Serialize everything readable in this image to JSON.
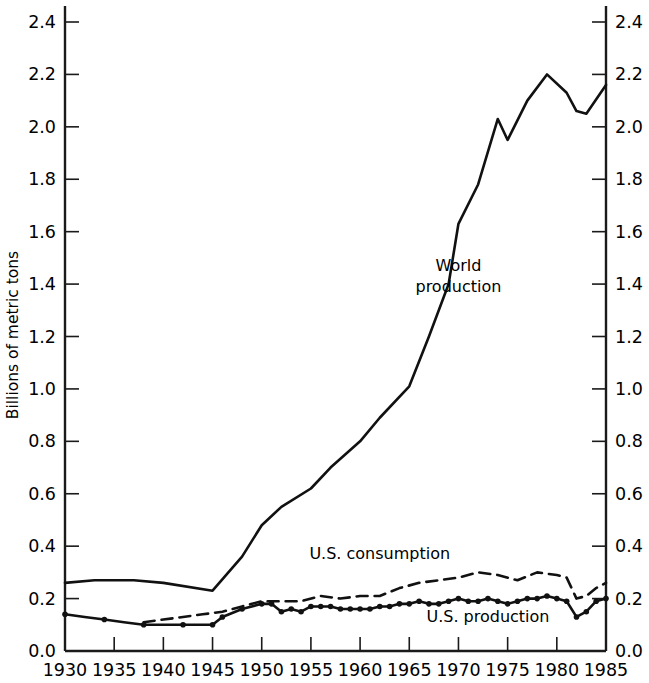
{
  "chart_data": {
    "type": "line",
    "title": "",
    "xlabel": "",
    "ylabel": "Billions of metric tons",
    "xlim": [
      1930,
      1985
    ],
    "ylim": [
      0.0,
      2.4
    ],
    "grid": false,
    "legend_position": "inline-annotations",
    "x_ticks": [
      1930,
      1935,
      1940,
      1945,
      1950,
      1955,
      1960,
      1965,
      1970,
      1975,
      1980,
      1985
    ],
    "x_tick_labels": [
      "1930",
      "1935",
      "1940",
      "1945",
      "1950",
      "1955",
      "1960",
      "1965",
      "1970",
      "1975",
      "1980",
      "1985"
    ],
    "y_ticks": [
      0.0,
      0.2,
      0.4,
      0.6,
      0.8,
      1.0,
      1.2,
      1.4,
      1.6,
      1.8,
      2.0,
      2.2,
      2.4
    ],
    "y_tick_labels": [
      "0.0",
      "0.2",
      "0.4",
      "0.6",
      "0.8",
      "1.0",
      "1.2",
      "1.4",
      "1.6",
      "1.8",
      "2.0",
      "2.2",
      "2.4"
    ],
    "y_tick_labels_right": [
      "0.0",
      "0.2",
      "0.4",
      "0.6",
      "0.8",
      "1.0",
      "1.2",
      "1.4",
      "1.6",
      "1.8",
      "2.0",
      "2.2",
      "2.4"
    ],
    "dual_axis": true,
    "series": [
      {
        "name": "World production",
        "style": "solid",
        "markers": false,
        "color": "#111111",
        "x": [
          1930,
          1933,
          1937,
          1940,
          1945,
          1948,
          1950,
          1952,
          1955,
          1957,
          1960,
          1962,
          1965,
          1967,
          1969,
          1970,
          1972,
          1974,
          1975,
          1977,
          1979,
          1981,
          1982,
          1983,
          1985
        ],
        "values": [
          0.26,
          0.27,
          0.27,
          0.26,
          0.23,
          0.36,
          0.48,
          0.55,
          0.62,
          0.7,
          0.8,
          0.89,
          1.01,
          1.2,
          1.4,
          1.63,
          1.78,
          2.03,
          1.95,
          2.1,
          2.2,
          2.13,
          2.06,
          2.05,
          2.16
        ]
      },
      {
        "name": "U.S. consumption",
        "style": "dashed",
        "markers": false,
        "color": "#111111",
        "x": [
          1938,
          1940,
          1942,
          1944,
          1946,
          1948,
          1950,
          1952,
          1954,
          1956,
          1958,
          1960,
          1962,
          1964,
          1966,
          1968,
          1970,
          1972,
          1974,
          1976,
          1978,
          1980,
          1981,
          1982,
          1983,
          1984,
          1985
        ],
        "values": [
          0.11,
          0.12,
          0.13,
          0.14,
          0.15,
          0.17,
          0.19,
          0.19,
          0.19,
          0.21,
          0.2,
          0.21,
          0.21,
          0.24,
          0.26,
          0.27,
          0.28,
          0.3,
          0.29,
          0.27,
          0.3,
          0.29,
          0.28,
          0.2,
          0.21,
          0.24,
          0.26
        ]
      },
      {
        "name": "U.S. production",
        "style": "solid",
        "markers": true,
        "color": "#111111",
        "x": [
          1930,
          1932,
          1934,
          1936,
          1938,
          1940,
          1942,
          1944,
          1945,
          1946,
          1948,
          1950,
          1951,
          1952,
          1953,
          1954,
          1955,
          1956,
          1957,
          1958,
          1959,
          1960,
          1961,
          1962,
          1963,
          1964,
          1965,
          1966,
          1967,
          1968,
          1969,
          1970,
          1971,
          1972,
          1973,
          1974,
          1975,
          1976,
          1977,
          1978,
          1979,
          1980,
          1981,
          1982,
          1983,
          1984,
          1985
        ],
        "values": [
          0.14,
          0.13,
          0.12,
          0.11,
          0.1,
          0.1,
          0.1,
          0.1,
          0.1,
          0.13,
          0.16,
          0.18,
          0.18,
          0.15,
          0.16,
          0.15,
          0.17,
          0.17,
          0.17,
          0.16,
          0.16,
          0.16,
          0.16,
          0.17,
          0.17,
          0.18,
          0.18,
          0.19,
          0.18,
          0.18,
          0.19,
          0.2,
          0.19,
          0.19,
          0.2,
          0.19,
          0.18,
          0.19,
          0.2,
          0.2,
          0.21,
          0.2,
          0.19,
          0.13,
          0.15,
          0.19,
          0.2
        ]
      }
    ],
    "annotations": [
      {
        "text_line1": "World",
        "text_line2": "production",
        "x": 1970,
        "y": 1.45,
        "name": "world-production-label"
      },
      {
        "text": "U.S. consumption",
        "x": 1962,
        "y": 0.35,
        "name": "us-consumption-label"
      },
      {
        "text": "U.S. production",
        "x": 1973,
        "y": 0.11,
        "name": "us-production-label"
      }
    ]
  }
}
